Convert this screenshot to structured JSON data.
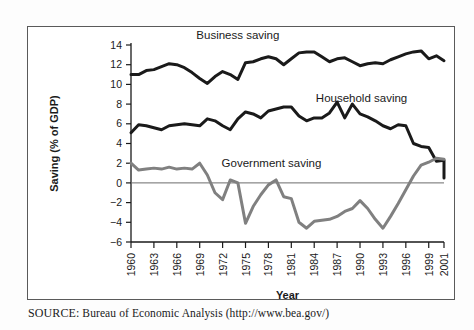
{
  "figure": {
    "source_label": "SOURCE:",
    "source_text": " Bureau of Economic Analysis (http://www.bea.gov/)"
  },
  "chart_data": {
    "type": "line",
    "title": "",
    "xlabel": "Year",
    "ylabel": "Saving (% of GDP)",
    "xlim": [
      1960,
      2001
    ],
    "ylim": [
      -6,
      14
    ],
    "ytick_labels": [
      "14",
      "12",
      "10",
      "8",
      "6",
      "4",
      "2",
      "0",
      "-2",
      "-4",
      "-6"
    ],
    "yticks": [
      14,
      12,
      10,
      8,
      6,
      4,
      2,
      0,
      -2,
      -4,
      -6
    ],
    "xtick_labels": [
      "1960",
      "1963",
      "1966",
      "1969",
      "1972",
      "1975",
      "1978",
      "1981",
      "1984",
      "1987",
      "1990",
      "1993",
      "1996",
      "1999",
      "2001"
    ],
    "xticks": [
      1960,
      1963,
      1966,
      1969,
      1972,
      1975,
      1978,
      1981,
      1984,
      1987,
      1990,
      1993,
      1996,
      1999,
      2001
    ],
    "grid": false,
    "zero_line": true,
    "legend": "inline-annotations",
    "annotations": [
      {
        "text": "Business saving",
        "x": 1974.0,
        "y": 14.6
      },
      {
        "text": "Household saving",
        "x": 1990.2,
        "y": 8.2
      },
      {
        "text": "Government saving",
        "x": 1978.4,
        "y": 1.6
      }
    ],
    "x": [
      1960,
      1961,
      1962,
      1963,
      1964,
      1965,
      1966,
      1967,
      1968,
      1969,
      1970,
      1971,
      1972,
      1973,
      1974,
      1975,
      1976,
      1977,
      1978,
      1979,
      1980,
      1981,
      1982,
      1983,
      1984,
      1985,
      1986,
      1987,
      1988,
      1989,
      1990,
      1991,
      1992,
      1993,
      1994,
      1995,
      1996,
      1997,
      1998,
      1999,
      2000,
      2001
    ],
    "series": [
      {
        "name": "Business saving",
        "color": "#1a1a1a",
        "width": 3.0,
        "values": [
          11.0,
          11.0,
          11.4,
          11.5,
          11.8,
          12.1,
          12.0,
          11.7,
          11.2,
          10.6,
          10.1,
          10.8,
          11.3,
          11.0,
          10.5,
          12.2,
          12.3,
          12.6,
          12.8,
          12.6,
          12.0,
          12.6,
          13.2,
          13.3,
          13.3,
          12.8,
          12.3,
          12.6,
          12.7,
          12.3,
          11.9,
          12.1,
          12.2,
          12.1,
          12.5,
          12.8,
          13.1,
          13.3,
          13.4,
          12.6,
          12.9,
          12.4
        ]
      },
      {
        "name": "Household saving",
        "color": "#1a1a1a",
        "width": 3.0,
        "values": [
          5.1,
          5.9,
          5.8,
          5.6,
          5.4,
          5.8,
          5.9,
          6.0,
          5.9,
          5.8,
          6.5,
          6.3,
          5.8,
          5.4,
          6.5,
          7.2,
          7.0,
          6.6,
          7.3,
          7.5,
          7.7,
          7.7,
          6.8,
          6.3,
          6.6,
          6.6,
          7.1,
          8.2,
          6.6,
          8.0,
          7.0,
          6.7,
          6.3,
          5.8,
          5.5,
          5.9,
          5.8,
          5.6,
          6.0,
          6.7,
          5.5,
          4.8
        ]
      },
      {
        "name": "Government saving",
        "color": "#808080",
        "width": 3.0,
        "values": [
          2.0,
          1.3,
          1.4,
          1.5,
          1.4,
          1.6,
          1.4,
          1.5,
          1.4,
          2.0,
          0.8,
          -1.0,
          -1.7,
          0.3,
          0.0,
          -4.1,
          -2.4,
          -1.2,
          -0.2,
          0.3,
          -1.4,
          -1.6,
          -4.0,
          -4.6,
          -3.9,
          -3.8,
          -3.7,
          -3.4,
          -2.9,
          -2.6,
          -1.8,
          -2.6,
          -3.7,
          -4.6,
          -3.4,
          -2.1,
          -0.7,
          0.7,
          1.8,
          2.1,
          2.5,
          2.4
        ]
      }
    ],
    "household_tail": {
      "years": [
        1997,
        1998,
        1999,
        2000,
        2001
      ],
      "values": [
        4.0,
        3.7,
        3.6,
        2.2,
        2.3,
        0.5
      ]
    }
  }
}
